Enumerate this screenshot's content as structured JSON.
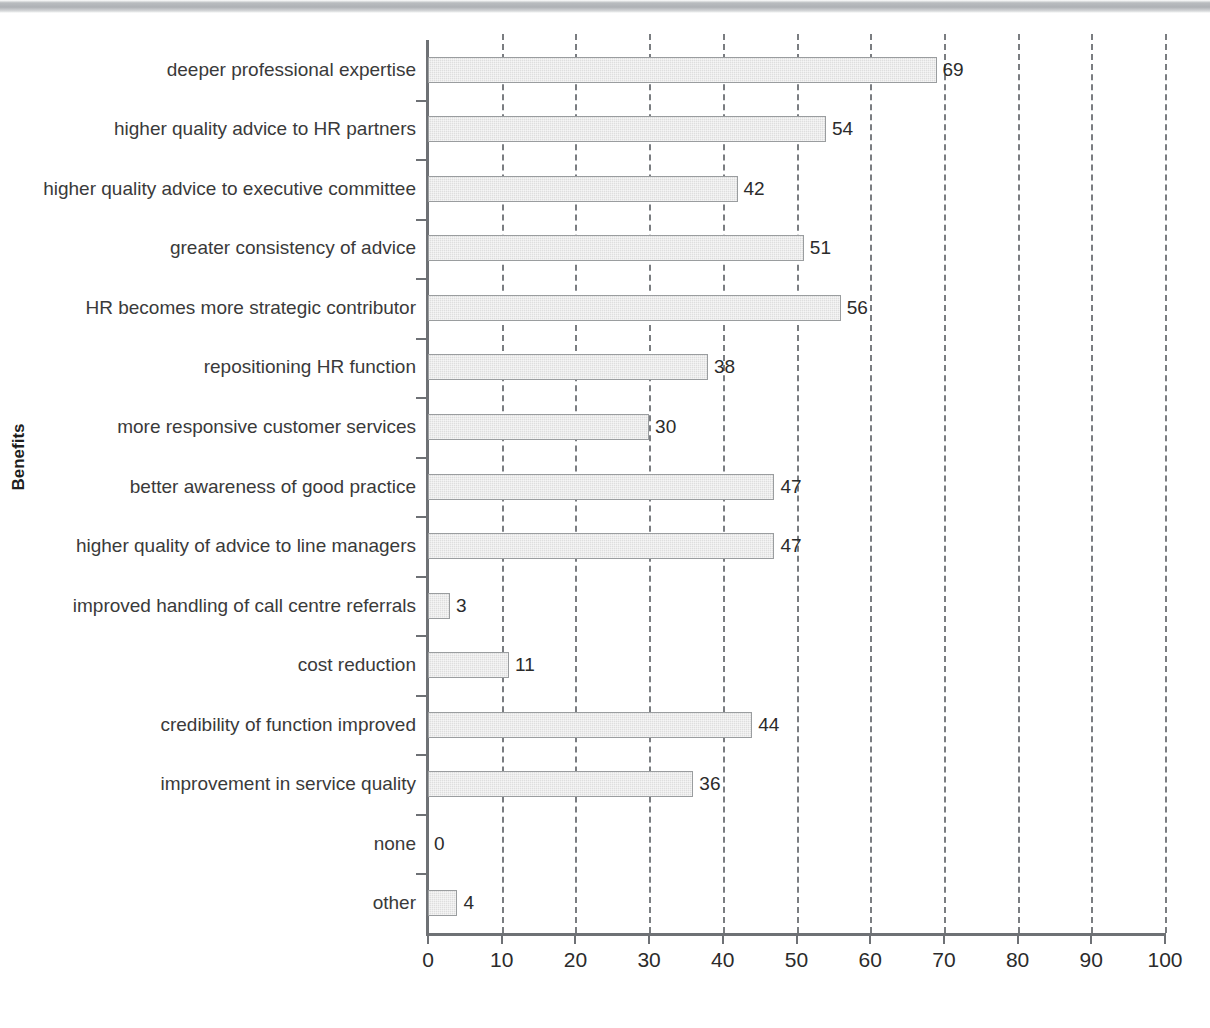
{
  "chart_data": {
    "type": "bar",
    "orientation": "horizontal",
    "title": "",
    "xlabel": "",
    "ylabel": "Benefits",
    "xlim": [
      0,
      100
    ],
    "xticks": [
      0,
      10,
      20,
      30,
      40,
      50,
      60,
      70,
      80,
      90,
      100
    ],
    "grid": "vertical-dashed",
    "legend": "none",
    "bar_color": "#dedede",
    "bar_border_color": "#9a9d9f",
    "axis_color": "#6e7175",
    "text_color": "#333333",
    "categories": [
      "deeper professional expertise",
      "higher quality advice to HR partners",
      "higher quality advice to executive committee",
      "greater consistency of advice",
      "HR becomes more strategic contributor",
      "repositioning HR function",
      "more responsive customer services",
      "better awareness of good practice",
      "higher quality of advice to line managers",
      "improved handling of call centre referrals",
      "cost reduction",
      "credibility of function improved",
      "improvement in service quality",
      "none",
      "other"
    ],
    "values": [
      69,
      54,
      42,
      51,
      56,
      38,
      30,
      47,
      47,
      3,
      11,
      44,
      36,
      0,
      4
    ],
    "value_labels": [
      "69",
      "54",
      "42",
      "51",
      "56",
      "38",
      "30",
      "47",
      "47",
      "3",
      "11",
      "44",
      "36",
      "0",
      "4"
    ],
    "xtick_labels": [
      "0",
      "10",
      "20",
      "30",
      "40",
      "50",
      "60",
      "70",
      "80",
      "90",
      "100"
    ]
  }
}
